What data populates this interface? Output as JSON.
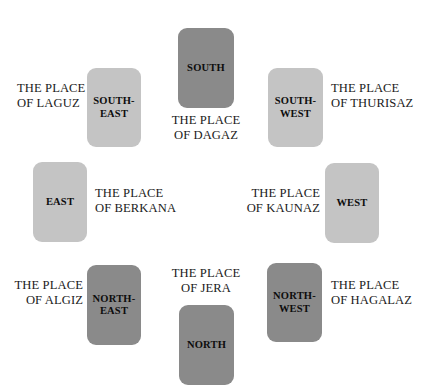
{
  "diagram": {
    "background_color": "#ffffff",
    "card_colors": {
      "light": "#c4c4c4",
      "dark": "#8a8a8a"
    },
    "text_color": "#1a1a1a"
  },
  "cards": [
    {
      "id": "south",
      "direction_label": "SOUTH",
      "shade": "dark"
    },
    {
      "id": "south-east",
      "direction_label": "SOUTH-\nEAST",
      "shade": "light"
    },
    {
      "id": "south-west",
      "direction_label": "SOUTH-\nWEST",
      "shade": "light"
    },
    {
      "id": "east",
      "direction_label": "EAST",
      "shade": "light"
    },
    {
      "id": "west",
      "direction_label": "WEST",
      "shade": "light"
    },
    {
      "id": "north-east",
      "direction_label": "NORTH-\nEAST",
      "shade": "dark"
    },
    {
      "id": "north-west",
      "direction_label": "NORTH-\nWEST",
      "shade": "dark"
    },
    {
      "id": "north",
      "direction_label": "NORTH",
      "shade": "dark"
    }
  ],
  "places": [
    {
      "id": "laguz",
      "text": "THE PLACE\nOF LAGUZ",
      "for_direction": "SOUTH-EAST"
    },
    {
      "id": "dagaz",
      "text": "THE PLACE\nOF DAGAZ",
      "for_direction": "SOUTH"
    },
    {
      "id": "thurisaz",
      "text": "THE PLACE\nOF THURISAZ",
      "for_direction": "SOUTH-WEST"
    },
    {
      "id": "berkana",
      "text": "THE PLACE\nOF BERKANA",
      "for_direction": "EAST"
    },
    {
      "id": "kaunaz",
      "text": "THE PLACE\nOF KAUNAZ",
      "for_direction": "WEST"
    },
    {
      "id": "algiz",
      "text": "THE PLACE\nOF ALGIZ",
      "for_direction": "NORTH-EAST"
    },
    {
      "id": "jera",
      "text": "THE PLACE\nOF JERA",
      "for_direction": "NORTH"
    },
    {
      "id": "hagalaz",
      "text": "THE PLACE\nOF HAGALAZ",
      "for_direction": "NORTH-WEST"
    }
  ]
}
